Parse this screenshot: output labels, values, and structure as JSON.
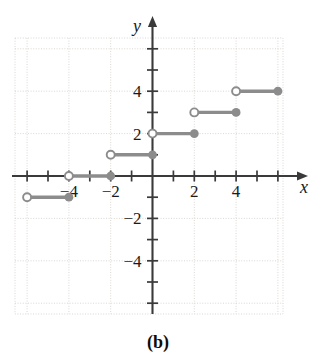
{
  "figure": {
    "panel_label": "(b)",
    "x_axis_name": "x",
    "y_axis_name": "y"
  },
  "chart_data": {
    "type": "line",
    "title": "",
    "subtitle": "",
    "xlabel": "x",
    "ylabel": "y",
    "xlim": [
      -6.5,
      6.2
    ],
    "ylim": [
      -6.3,
      6.3
    ],
    "xticks": [
      -6,
      -5,
      -4,
      -3,
      -2,
      -1,
      1,
      2,
      3,
      4,
      5,
      6
    ],
    "yticks": [
      -6,
      -5,
      -4,
      -3,
      -2,
      -1,
      1,
      2,
      3,
      4,
      5,
      6
    ],
    "xtick_labels": [
      {
        "value": -4,
        "text": "−4"
      },
      {
        "value": -2,
        "text": "−2"
      },
      {
        "value": 2,
        "text": "2"
      },
      {
        "value": 4,
        "text": "4"
      }
    ],
    "ytick_labels": [
      {
        "value": 4,
        "text": "4"
      },
      {
        "value": 2,
        "text": "2"
      },
      {
        "value": -2,
        "text": "−2"
      },
      {
        "value": -4,
        "text": "−4"
      }
    ],
    "grid": true,
    "grid_spacing": 2,
    "legend": null,
    "annotations": [
      "(b)"
    ],
    "series_color": "#8c8c8c",
    "segments": [
      {
        "y": -1,
        "x_start": -6,
        "x_end": -4,
        "left_endpoint": "open",
        "right_endpoint": "filled"
      },
      {
        "y": 0,
        "x_start": -4,
        "x_end": -2,
        "left_endpoint": "open",
        "right_endpoint": "filled"
      },
      {
        "y": 1,
        "x_start": -2,
        "x_end": 0,
        "left_endpoint": "open",
        "right_endpoint": "filled"
      },
      {
        "y": 2,
        "x_start": 0,
        "x_end": 2,
        "left_endpoint": "open",
        "right_endpoint": "filled"
      },
      {
        "y": 3,
        "x_start": 2,
        "x_end": 4,
        "left_endpoint": "open",
        "right_endpoint": "filled"
      },
      {
        "y": 4,
        "x_start": 4,
        "x_end": 6,
        "left_endpoint": "open",
        "right_endpoint": "filled"
      }
    ]
  }
}
